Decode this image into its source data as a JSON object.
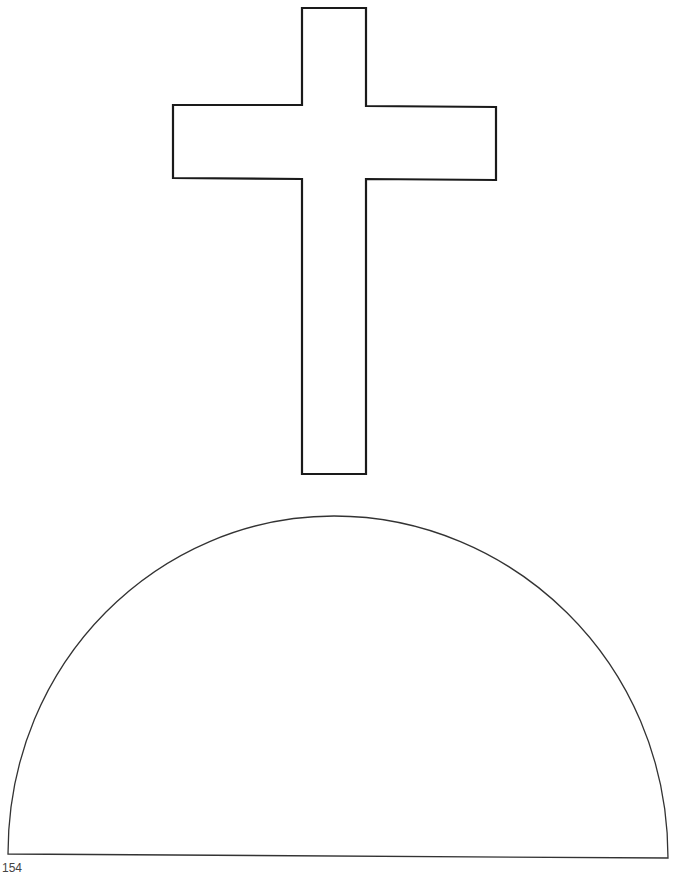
{
  "page": {
    "number": "154",
    "background": "#ffffff"
  },
  "shapes": {
    "cross": {
      "label": "cross",
      "stroke": "#1a1a1a"
    },
    "hill": {
      "label": "hill semicircle",
      "stroke": "#333333"
    }
  }
}
